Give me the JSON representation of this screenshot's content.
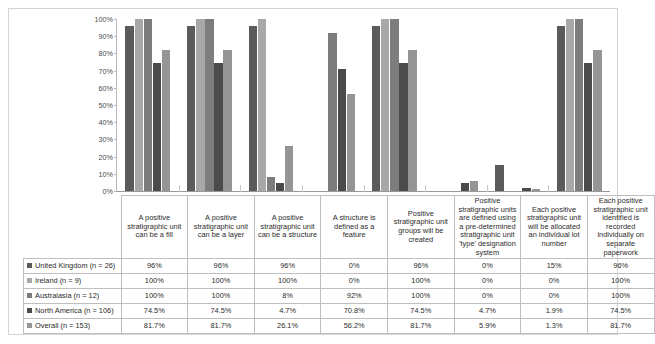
{
  "chart_data": {
    "type": "bar",
    "title": "",
    "xlabel": "",
    "ylabel": "",
    "ylim": [
      0,
      100
    ],
    "grid": false,
    "legend_position": "table-left",
    "ytick_labels": [
      "100%",
      "90%",
      "80%",
      "70%",
      "60%",
      "50%",
      "40%",
      "30%",
      "20%",
      "10%",
      "0%"
    ],
    "ytick_values": [
      100,
      90,
      80,
      70,
      60,
      50,
      40,
      30,
      20,
      10,
      0
    ],
    "categories": [
      "A positive stratigraphic unit can be a fill",
      "A positive stratigraphic unit can be a layer",
      "A positive stratigraphic unit can be a structure",
      "A structure is defined as a feature",
      "Positive stratigraphic unit groups will be created",
      "Positive stratigraphic units are defined using a pre-determined stratigraphic unit 'type' designation system",
      "Each positive stratigraphic unit will be allocated an individual lot number",
      "Each positive stratigraphic unit identified is recorded individually on separate paperwork"
    ],
    "series": [
      {
        "name": "United Kingdom (n = 26)",
        "color": "#5b5b5b",
        "values": [
          96,
          96,
          96,
          0,
          96,
          0,
          15,
          96
        ],
        "labels": [
          "96%",
          "96%",
          "96%",
          "0%",
          "96%",
          "0%",
          "15%",
          "96%"
        ]
      },
      {
        "name": "Ireland (n = 9)",
        "color": "#a8a8a8",
        "values": [
          100,
          100,
          100,
          0,
          100,
          0,
          0,
          100
        ],
        "labels": [
          "100%",
          "100%",
          "100%",
          "0%",
          "100%",
          "0%",
          "0%",
          "100%"
        ]
      },
      {
        "name": "Australasia (n = 12)",
        "color": "#7d7d7d",
        "values": [
          100,
          100,
          8,
          92,
          100,
          0,
          0,
          100
        ],
        "labels": [
          "100%",
          "100%",
          "8%",
          "92%",
          "100%",
          "0%",
          "0%",
          "100%"
        ]
      },
      {
        "name": "North America (n = 106)",
        "color": "#4b4b4b",
        "values": [
          74.5,
          74.5,
          4.7,
          70.8,
          74.5,
          4.7,
          1.9,
          74.5
        ],
        "labels": [
          "74.5%",
          "74.5%",
          "4.7%",
          "70.8%",
          "74.5%",
          "4.7%",
          "1.9%",
          "74.5%"
        ]
      },
      {
        "name": "Overall (n = 153)",
        "color": "#959595",
        "values": [
          81.7,
          81.7,
          26.1,
          56.2,
          81.7,
          5.9,
          1.3,
          81.7
        ],
        "labels": [
          "81.7%",
          "81.7%",
          "26.1%",
          "56.2%",
          "81.7%",
          "5.9%",
          "1.3%",
          "81.7%"
        ]
      }
    ]
  }
}
